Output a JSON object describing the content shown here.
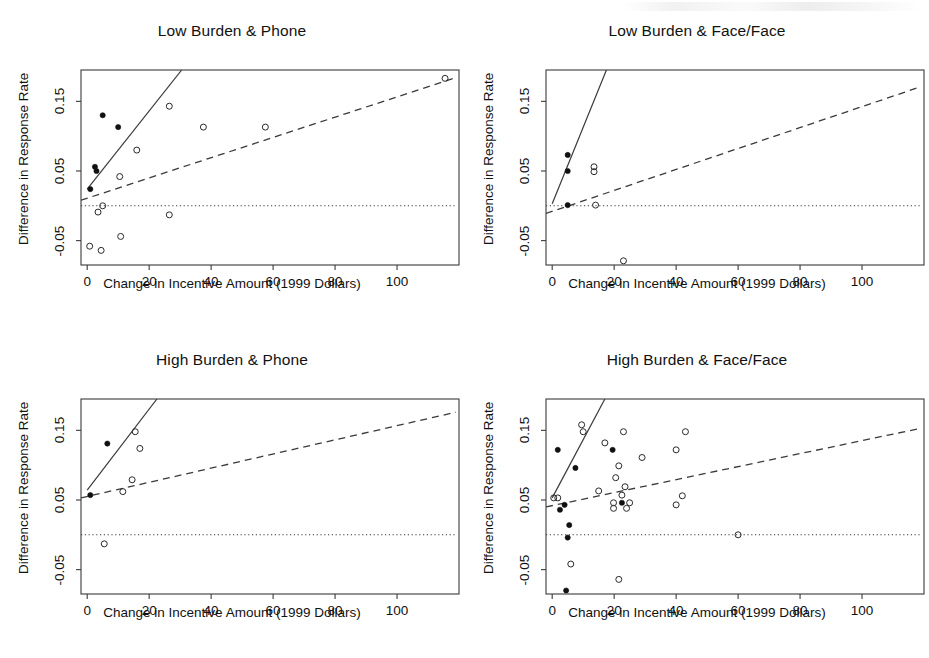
{
  "figure": {
    "background": "#ffffff",
    "ink_color": "#1a1a1a",
    "panel_count": 4
  },
  "common": {
    "xlabel": "Change in Incentive Amount (1999 Dollars)",
    "ylabel": "Difference in Response Rate",
    "xticks": [
      0,
      20,
      40,
      60,
      80,
      100
    ],
    "yticks": [
      -0.05,
      0.05,
      0.15
    ],
    "ytick_labels": [
      "-0.05",
      "0.05",
      "0.15"
    ],
    "xtick_labels": [
      "0",
      "20",
      "40",
      "60",
      "80",
      "100"
    ],
    "xlim": [
      -2,
      120
    ],
    "ylim": [
      -0.085,
      0.195
    ],
    "zero_reference_line": 0,
    "series_legend": [
      {
        "name": "filled-circle",
        "description": "Filled point"
      },
      {
        "name": "open-circle",
        "description": "Open point"
      },
      {
        "name": "solid-line",
        "description": "Solid fitted line"
      },
      {
        "name": "dashed-line",
        "description": "Dashed fitted line"
      },
      {
        "name": "dotted-line",
        "description": "Dotted zero reference line"
      }
    ]
  },
  "chart_data": [
    {
      "type": "scatter",
      "panel_id": "low-burden-phone",
      "title": "Low Burden & Phone",
      "xlabel": "Change in Incentive Amount (1999 Dollars)",
      "ylabel": "Difference in Response Rate",
      "xlim": [
        -2,
        120
      ],
      "ylim": [
        -0.085,
        0.195
      ],
      "grid": false,
      "legend": "none",
      "series": [
        {
          "name": "filled-points",
          "marker": "filled-circle",
          "points": [
            {
              "x": 1.0,
              "y": 0.024
            },
            {
              "x": 2.5,
              "y": 0.056
            },
            {
              "x": 3.0,
              "y": 0.05
            },
            {
              "x": 5.0,
              "y": 0.13
            },
            {
              "x": 10.0,
              "y": 0.113
            }
          ]
        },
        {
          "name": "open-points",
          "marker": "open-circle",
          "points": [
            {
              "x": 0.8,
              "y": -0.058
            },
            {
              "x": 4.5,
              "y": -0.064
            },
            {
              "x": 5.0,
              "y": 0.0
            },
            {
              "x": 3.5,
              "y": -0.009
            },
            {
              "x": 10.5,
              "y": 0.042
            },
            {
              "x": 10.8,
              "y": -0.044
            },
            {
              "x": 16.0,
              "y": 0.08
            },
            {
              "x": 26.5,
              "y": 0.143
            },
            {
              "x": 26.5,
              "y": -0.013
            },
            {
              "x": 37.5,
              "y": 0.113
            },
            {
              "x": 57.5,
              "y": 0.113
            },
            {
              "x": 115.5,
              "y": 0.183
            }
          ]
        }
      ],
      "lines": [
        {
          "name": "solid-fit",
          "style": "solid",
          "x0": 0.0,
          "y0": 0.024,
          "x1": 30.5,
          "y1": 0.195
        },
        {
          "name": "dashed-fit",
          "style": "dashed",
          "x0": -2.0,
          "y0": 0.008,
          "x1": 119.0,
          "y1": 0.184
        },
        {
          "name": "zero-reference",
          "style": "dotted",
          "x0": -2.0,
          "y0": 0.0,
          "x1": 119.0,
          "y1": 0.0
        }
      ]
    },
    {
      "type": "scatter",
      "panel_id": "low-burden-face-face",
      "title": "Low Burden & Face/Face",
      "xlabel": "Change in Incentive Amount (1999 Dollars)",
      "ylabel": "Difference in Response Rate",
      "xlim": [
        -2,
        120
      ],
      "ylim": [
        -0.085,
        0.195
      ],
      "grid": false,
      "legend": "none",
      "series": [
        {
          "name": "filled-points",
          "marker": "filled-circle",
          "points": [
            {
              "x": 5.0,
              "y": 0.073
            },
            {
              "x": 5.0,
              "y": 0.05
            },
            {
              "x": 5.0,
              "y": 0.001
            }
          ]
        },
        {
          "name": "open-points",
          "marker": "open-circle",
          "points": [
            {
              "x": 13.5,
              "y": 0.056
            },
            {
              "x": 13.5,
              "y": 0.049
            },
            {
              "x": 14.0,
              "y": 0.001
            },
            {
              "x": 23.0,
              "y": -0.079
            }
          ]
        }
      ],
      "lines": [
        {
          "name": "solid-fit",
          "style": "solid",
          "x0": 0.0,
          "y0": 0.003,
          "x1": 17.5,
          "y1": 0.195
        },
        {
          "name": "dashed-fit",
          "style": "dashed",
          "x0": -2.0,
          "y0": -0.011,
          "x1": 119.0,
          "y1": 0.171
        },
        {
          "name": "zero-reference",
          "style": "dotted",
          "x0": -2.0,
          "y0": 0.0,
          "x1": 119.0,
          "y1": 0.0
        }
      ]
    },
    {
      "type": "scatter",
      "panel_id": "high-burden-phone",
      "title": "High Burden & Phone",
      "xlabel": "Change in Incentive Amount (1999 Dollars)",
      "ylabel": "Difference in Response Rate",
      "xlim": [
        -2,
        120
      ],
      "ylim": [
        -0.085,
        0.195
      ],
      "grid": false,
      "legend": "none",
      "series": [
        {
          "name": "filled-points",
          "marker": "filled-circle",
          "points": [
            {
              "x": 1.0,
              "y": 0.057
            },
            {
              "x": 6.5,
              "y": 0.131
            }
          ]
        },
        {
          "name": "open-points",
          "marker": "open-circle",
          "points": [
            {
              "x": 5.5,
              "y": -0.013
            },
            {
              "x": 11.5,
              "y": 0.062
            },
            {
              "x": 14.5,
              "y": 0.079
            },
            {
              "x": 15.5,
              "y": 0.148
            },
            {
              "x": 17.0,
              "y": 0.124
            }
          ]
        }
      ],
      "lines": [
        {
          "name": "solid-fit",
          "style": "solid",
          "x0": 0.0,
          "y0": 0.064,
          "x1": 22.5,
          "y1": 0.195
        },
        {
          "name": "dashed-fit",
          "style": "dashed",
          "x0": -2.0,
          "y0": 0.053,
          "x1": 119.0,
          "y1": 0.176
        },
        {
          "name": "zero-reference",
          "style": "dotted",
          "x0": -2.0,
          "y0": 0.0,
          "x1": 119.0,
          "y1": 0.0
        }
      ]
    },
    {
      "type": "scatter",
      "panel_id": "high-burden-face-face",
      "title": "High Burden & Face/Face",
      "xlabel": "Change in Incentive Amount (1999 Dollars)",
      "ylabel": "Difference in Response Rate",
      "xlim": [
        -2,
        120
      ],
      "ylim": [
        -0.085,
        0.195
      ],
      "grid": false,
      "legend": "none",
      "series": [
        {
          "name": "filled-points",
          "marker": "filled-circle",
          "points": [
            {
              "x": 1.8,
              "y": 0.122
            },
            {
              "x": 7.5,
              "y": 0.096
            },
            {
              "x": 2.5,
              "y": 0.036
            },
            {
              "x": 4.0,
              "y": 0.043
            },
            {
              "x": 5.5,
              "y": 0.014
            },
            {
              "x": 5.0,
              "y": -0.004
            },
            {
              "x": 19.5,
              "y": 0.122
            },
            {
              "x": 22.5,
              "y": 0.046
            },
            {
              "x": 4.5,
              "y": -0.08
            }
          ]
        },
        {
          "name": "open-points",
          "marker": "open-circle",
          "points": [
            {
              "x": 9.5,
              "y": 0.158
            },
            {
              "x": 10.0,
              "y": 0.148
            },
            {
              "x": 23.0,
              "y": 0.148
            },
            {
              "x": 43.0,
              "y": 0.148
            },
            {
              "x": 17.0,
              "y": 0.132
            },
            {
              "x": 40.0,
              "y": 0.122
            },
            {
              "x": 29.0,
              "y": 0.111
            },
            {
              "x": 21.5,
              "y": 0.099
            },
            {
              "x": 20.5,
              "y": 0.082
            },
            {
              "x": 15.0,
              "y": 0.063
            },
            {
              "x": 23.5,
              "y": 0.069
            },
            {
              "x": 22.5,
              "y": 0.057
            },
            {
              "x": 0.5,
              "y": 0.053
            },
            {
              "x": 1.8,
              "y": 0.053
            },
            {
              "x": 42.0,
              "y": 0.056
            },
            {
              "x": 19.8,
              "y": 0.046
            },
            {
              "x": 25.0,
              "y": 0.046
            },
            {
              "x": 40.0,
              "y": 0.043
            },
            {
              "x": 19.8,
              "y": 0.038
            },
            {
              "x": 24.0,
              "y": 0.038
            },
            {
              "x": 6.0,
              "y": -0.042
            },
            {
              "x": 21.5,
              "y": -0.064
            },
            {
              "x": 60.0,
              "y": 0.0
            }
          ]
        }
      ],
      "lines": [
        {
          "name": "solid-fit",
          "style": "solid",
          "x0": 0.0,
          "y0": 0.053,
          "x1": 17.0,
          "y1": 0.195
        },
        {
          "name": "dashed-fit",
          "style": "dashed",
          "x0": -2.0,
          "y0": 0.04,
          "x1": 119.0,
          "y1": 0.153
        },
        {
          "name": "zero-reference",
          "style": "dotted",
          "x0": -2.0,
          "y0": 0.0,
          "x1": 119.0,
          "y1": 0.0
        }
      ]
    }
  ]
}
